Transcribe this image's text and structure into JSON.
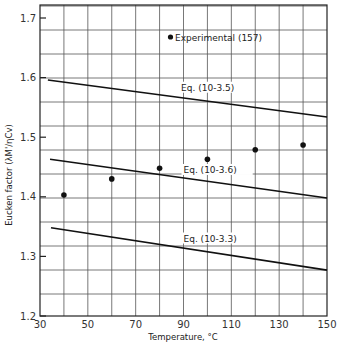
{
  "chart_data": {
    "type": "line",
    "title": "",
    "xlabel": "Temperature, °C",
    "ylabel": "Eucken factor (λM'/ηCv)",
    "xlim": [
      30,
      150
    ],
    "ylim": [
      1.2,
      1.72
    ],
    "x_ticks": [
      30,
      50,
      70,
      90,
      110,
      130,
      150
    ],
    "y_ticks": [
      1.2,
      1.3,
      1.4,
      1.5,
      1.6,
      1.7
    ],
    "x_tick_labels": [
      "30",
      "50",
      "70",
      "90",
      "110",
      "130",
      "150"
    ],
    "y_tick_labels": [
      "1.2",
      "1.3",
      "1.4",
      "1.5",
      "1.6",
      "1.7"
    ],
    "grid": true,
    "grid_x_step": 10,
    "grid_y_step": 0.04,
    "legend": {
      "position": "upper-center",
      "entries": [
        {
          "label": "Experimental (157)",
          "marker": "filled-circle"
        }
      ]
    },
    "series": [
      {
        "name": "Experimental (157)",
        "kind": "scatter",
        "x": [
          40,
          60,
          80,
          100,
          120,
          140
        ],
        "y": [
          1.403,
          1.43,
          1.448,
          1.463,
          1.479,
          1.487
        ]
      },
      {
        "name": "Eq. (10-3.5)",
        "kind": "line",
        "x": [
          33.3,
          150
        ],
        "y": [
          1.596,
          1.534
        ],
        "label_at": [
          89,
          1.578
        ]
      },
      {
        "name": "Eq. (10-3.6)",
        "kind": "line",
        "x": [
          34.2,
          150
        ],
        "y": [
          1.463,
          1.398
        ],
        "label_at": [
          90,
          1.44
        ]
      },
      {
        "name": "Eq. (10-3.3)",
        "kind": "line",
        "x": [
          34.6,
          150
        ],
        "y": [
          1.348,
          1.277
        ],
        "label_at": [
          90,
          1.325
        ]
      }
    ]
  }
}
